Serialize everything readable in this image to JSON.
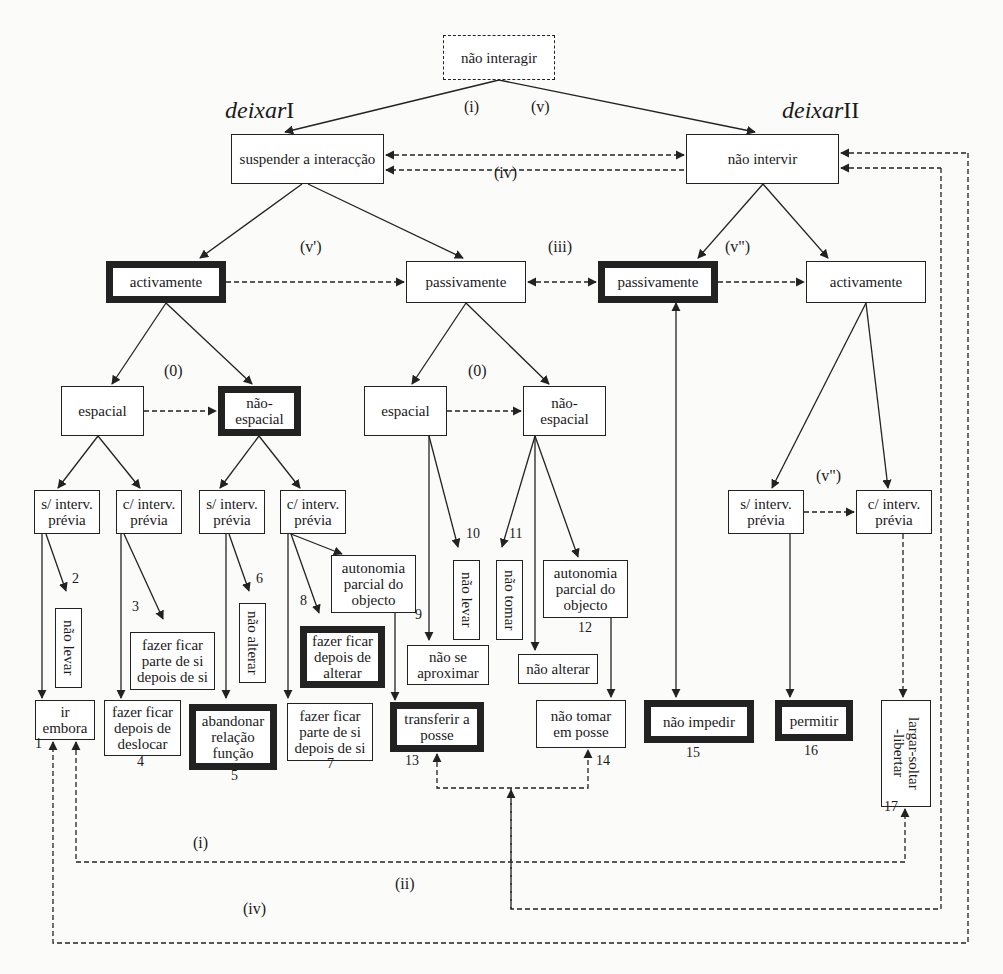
{
  "diagram": {
    "title_nodes": {
      "deixar1": {
        "italic": "deixar",
        "roman": "I",
        "x": 232,
        "y": 128
      },
      "deixar2": {
        "italic": "deixar",
        "roman": "II",
        "x": 783,
        "y": 128
      }
    },
    "nodes": [
      {
        "id": "nao-interagir",
        "text": "não interagir",
        "x": 443,
        "y": 35,
        "w": 112,
        "h": 45,
        "style": "dashed"
      },
      {
        "id": "suspender",
        "text": "suspender a interacção",
        "x": 231,
        "y": 134,
        "w": 153,
        "h": 50,
        "style": "normal"
      },
      {
        "id": "nao-intervir",
        "text": "não intervir",
        "x": 686,
        "y": 134,
        "w": 153,
        "h": 50,
        "style": "normal"
      },
      {
        "id": "activamente-1",
        "text": "activamente",
        "x": 106,
        "y": 261,
        "w": 120,
        "h": 42,
        "style": "thick"
      },
      {
        "id": "passivamente-1",
        "text": "passivamente",
        "x": 406,
        "y": 261,
        "w": 120,
        "h": 42,
        "style": "normal"
      },
      {
        "id": "passivamente-2",
        "text": "passivamente",
        "x": 598,
        "y": 261,
        "w": 120,
        "h": 42,
        "style": "thick"
      },
      {
        "id": "activamente-2",
        "text": "activamente",
        "x": 806,
        "y": 261,
        "w": 120,
        "h": 42,
        "style": "normal"
      },
      {
        "id": "espacial-1",
        "text": "espacial",
        "x": 61,
        "y": 386,
        "w": 83,
        "h": 50,
        "style": "normal"
      },
      {
        "id": "nao-espacial-1",
        "text": "não-\nespacial",
        "x": 218,
        "y": 386,
        "w": 83,
        "h": 50,
        "style": "thick"
      },
      {
        "id": "espacial-2",
        "text": "espacial",
        "x": 364,
        "y": 386,
        "w": 83,
        "h": 50,
        "style": "normal"
      },
      {
        "id": "nao-espacial-2",
        "text": "não-\nespacial",
        "x": 523,
        "y": 386,
        "w": 83,
        "h": 50,
        "style": "normal"
      },
      {
        "id": "s-interv-1",
        "text": "s/ interv.\nprévia",
        "x": 34,
        "y": 490,
        "w": 66,
        "h": 44,
        "style": "normal"
      },
      {
        "id": "c-interv-1",
        "text": "c/ interv.\nprévia",
        "x": 116,
        "y": 490,
        "w": 66,
        "h": 44,
        "style": "normal"
      },
      {
        "id": "s-interv-2",
        "text": "s/ interv.\nprévia",
        "x": 199,
        "y": 490,
        "w": 66,
        "h": 44,
        "style": "normal"
      },
      {
        "id": "c-interv-2",
        "text": "c/ interv.\nprévia",
        "x": 280,
        "y": 490,
        "w": 66,
        "h": 44,
        "style": "normal"
      },
      {
        "id": "s-interv-3",
        "text": "s/ interv.\nprévia",
        "x": 728,
        "y": 490,
        "w": 76,
        "h": 44,
        "style": "normal"
      },
      {
        "id": "c-interv-3",
        "text": "c/ interv.\nprévia",
        "x": 856,
        "y": 490,
        "w": 76,
        "h": 44,
        "style": "normal"
      },
      {
        "id": "autonomia-1",
        "text": "autonomia\nparcial do\nobjecto",
        "x": 331,
        "y": 555,
        "w": 85,
        "h": 58,
        "style": "normal"
      },
      {
        "id": "autonomia-2",
        "text": "autonomia\nparcial do\nobjecto",
        "x": 543,
        "y": 560,
        "w": 85,
        "h": 58,
        "style": "normal"
      },
      {
        "id": "nao-levar-1",
        "text": "não levar",
        "x": 55,
        "y": 608,
        "w": 27,
        "h": 80,
        "style": "vertical"
      },
      {
        "id": "nao-alterar-1",
        "text": "não alterar",
        "x": 239,
        "y": 603,
        "w": 27,
        "h": 80,
        "style": "vertical"
      },
      {
        "id": "nao-levar-2",
        "text": "não levar",
        "x": 453,
        "y": 560,
        "w": 27,
        "h": 80,
        "style": "vertical"
      },
      {
        "id": "nao-tomar",
        "text": "não tomar",
        "x": 496,
        "y": 560,
        "w": 27,
        "h": 80,
        "style": "vertical"
      },
      {
        "id": "fazer-ficar-1",
        "text": "fazer ficar\nparte de si\ndepois de si",
        "x": 130,
        "y": 632,
        "w": 85,
        "h": 58,
        "style": "normal"
      },
      {
        "id": "fazer-ficar-alterar",
        "text": "fazer ficar\ndepois de\nalterar",
        "x": 300,
        "y": 626,
        "w": 85,
        "h": 62,
        "style": "thick"
      },
      {
        "id": "nao-se-aproximar",
        "text": "não se\naproximar",
        "x": 407,
        "y": 645,
        "w": 82,
        "h": 40,
        "style": "normal"
      },
      {
        "id": "nao-alterar-2",
        "text": "não alterar",
        "x": 518,
        "y": 654,
        "w": 80,
        "h": 30,
        "style": "normal"
      },
      {
        "id": "ir-embora",
        "text": "ir\nembora",
        "x": 35,
        "y": 700,
        "w": 60,
        "h": 40,
        "style": "normal"
      },
      {
        "id": "fazer-ficar-deslocar",
        "text": "fazer ficar\ndepois de\ndeslocar",
        "x": 104,
        "y": 700,
        "w": 77,
        "h": 56,
        "style": "normal"
      },
      {
        "id": "abandonar",
        "text": "abandonar\nrelação\nfunção",
        "x": 189,
        "y": 704,
        "w": 88,
        "h": 66,
        "style": "thick"
      },
      {
        "id": "fazer-ficar-2",
        "text": "fazer ficar\nparte de si\ndepois de si",
        "x": 287,
        "y": 703,
        "w": 86,
        "h": 58,
        "style": "normal"
      },
      {
        "id": "transferir",
        "text": "transferir a\nposse",
        "x": 390,
        "y": 702,
        "w": 94,
        "h": 50,
        "style": "thick"
      },
      {
        "id": "nao-tomar-posse",
        "text": "não tomar\nem posse",
        "x": 536,
        "y": 700,
        "w": 90,
        "h": 48,
        "style": "normal"
      },
      {
        "id": "nao-impedir",
        "text": "não impedir",
        "x": 644,
        "y": 700,
        "w": 110,
        "h": 43,
        "style": "thick"
      },
      {
        "id": "permitir",
        "text": "permitir",
        "x": 775,
        "y": 700,
        "w": 78,
        "h": 41,
        "style": "thick"
      },
      {
        "id": "largar",
        "text": "largar-soltar\n-libertar",
        "x": 881,
        "y": 700,
        "w": 50,
        "h": 107,
        "style": "vertical"
      }
    ],
    "edge_labels": [
      {
        "text": "(i)",
        "x": 464,
        "y": 116
      },
      {
        "text": "(v)",
        "x": 531,
        "y": 116
      },
      {
        "text": "(iv)",
        "x": 494,
        "y": 182
      },
      {
        "text": "(v')",
        "x": 300,
        "y": 256
      },
      {
        "text": "(iii)",
        "x": 548,
        "y": 256
      },
      {
        "text": "(v\")",
        "x": 725,
        "y": 256
      },
      {
        "text": "(0)",
        "x": 164,
        "y": 380
      },
      {
        "text": "(0)",
        "x": 468,
        "y": 380
      },
      {
        "text": "(v\")",
        "x": 816,
        "y": 485
      },
      {
        "text": "(i)",
        "x": 193,
        "y": 852
      },
      {
        "text": "(ii)",
        "x": 395,
        "y": 893
      },
      {
        "text": "(iv)",
        "x": 243,
        "y": 918
      }
    ],
    "numbers": [
      {
        "text": "1",
        "x": 35,
        "y": 750
      },
      {
        "text": "2",
        "x": 72,
        "y": 585
      },
      {
        "text": "3",
        "x": 132,
        "y": 613
      },
      {
        "text": "4",
        "x": 137,
        "y": 768
      },
      {
        "text": "5",
        "x": 231,
        "y": 782
      },
      {
        "text": "6",
        "x": 256,
        "y": 585
      },
      {
        "text": "7",
        "x": 327,
        "y": 770
      },
      {
        "text": "8",
        "x": 300,
        "y": 607
      },
      {
        "text": "9",
        "x": 415,
        "y": 621
      },
      {
        "text": "10",
        "x": 466,
        "y": 540
      },
      {
        "text": "11",
        "x": 509,
        "y": 540
      },
      {
        "text": "12",
        "x": 578,
        "y": 634
      },
      {
        "text": "13",
        "x": 405,
        "y": 767
      },
      {
        "text": "14",
        "x": 596,
        "y": 767
      },
      {
        "text": "15",
        "x": 686,
        "y": 759
      },
      {
        "text": "16",
        "x": 804,
        "y": 757
      },
      {
        "text": "17",
        "x": 884,
        "y": 813
      }
    ],
    "colors": {
      "stroke": "#222222",
      "background": "#fbfbfa",
      "box_fill": "#ffffff"
    }
  }
}
